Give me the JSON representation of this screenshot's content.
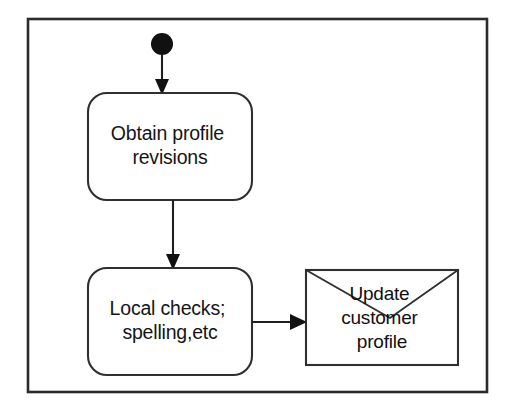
{
  "diagram": {
    "kind": "uml-activity-diagram",
    "background_color": "#ffffff",
    "line_color": "#2f2f2f",
    "text_color": "#151515",
    "frame": {
      "label": "diagram-frame",
      "x": 28,
      "y": 19,
      "width": 459,
      "height": 373
    },
    "initial_node": {
      "label": "initial-node",
      "cx": 162,
      "cy": 44,
      "r": 11,
      "fill": "#111111"
    },
    "activities": [
      {
        "id": "obtain-profile-revisions",
        "lines": [
          "Obtain profile",
          "revisions"
        ],
        "x": 88,
        "y": 93,
        "width": 164,
        "height": 107,
        "rx": 19
      },
      {
        "id": "local-checks",
        "lines": [
          "Local checks;",
          "spelling,etc"
        ],
        "x": 88,
        "y": 268,
        "width": 164,
        "height": 107,
        "rx": 19
      }
    ],
    "signal": {
      "id": "update-customer-profile",
      "lines": [
        "Update",
        "customer",
        "profile"
      ],
      "x": 306,
      "y": 270,
      "width": 152,
      "height": 95,
      "flap_vertex_x": 390,
      "flap_vertex_y": 318
    },
    "flows": [
      {
        "id": "flow-initial-to-obtain",
        "from": "initial-node",
        "to": "obtain-profile-revisions",
        "orientation": "vertical",
        "x1": 162,
        "y1": 55,
        "x2": 162,
        "y2": 93
      },
      {
        "id": "flow-obtain-to-checks",
        "from": "obtain-profile-revisions",
        "to": "local-checks",
        "orientation": "vertical",
        "x1": 173,
        "y1": 200,
        "x2": 173,
        "y2": 268
      },
      {
        "id": "flow-checks-to-signal",
        "from": "local-checks",
        "to": "update-customer-profile",
        "orientation": "horizontal",
        "x1": 252,
        "y1": 322,
        "x2": 306,
        "y2": 322
      }
    ]
  }
}
